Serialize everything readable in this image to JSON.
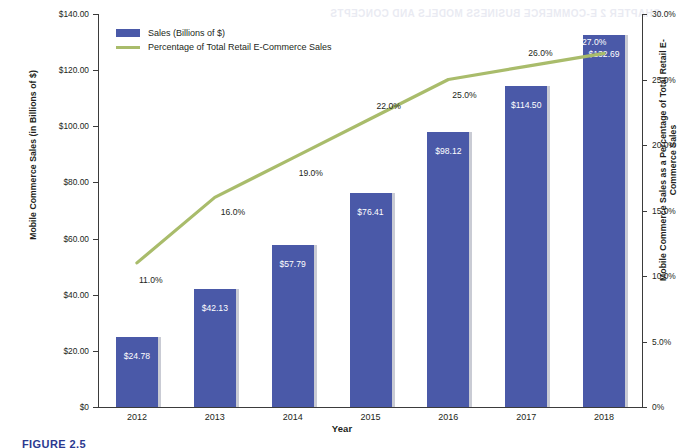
{
  "figure": {
    "caption": "FIGURE 2.5"
  },
  "legend": {
    "position": "top-left",
    "items": [
      {
        "label": "Sales (Billions of $)",
        "type": "bar",
        "color": "#4a59a8"
      },
      {
        "label": "Percentage of Total Retail E-Commerce Sales",
        "type": "line",
        "color": "#a9bc6b"
      }
    ]
  },
  "chart_data": {
    "type": "bar",
    "title": "",
    "subtitle": "",
    "xlabel": "Year",
    "ylabel": "Mobile Commerce Sales (in Billions of $)",
    "y2label": "Mobile Commerce Sales as a Percentage of Total Retail E-Commerce Sales",
    "categories": [
      "2012",
      "2013",
      "2014",
      "2015",
      "2016",
      "2017",
      "2018"
    ],
    "ylim": [
      0,
      140
    ],
    "y2lim": [
      0,
      30
    ],
    "grid": false,
    "legend_position": "top-left",
    "y_ticks": [
      "$0",
      "$20.00",
      "$40.00",
      "$60.00",
      "$80.00",
      "$100.00",
      "$120.00",
      "$140.00"
    ],
    "y_tick_values": [
      0,
      20,
      40,
      60,
      80,
      100,
      120,
      140
    ],
    "y2_ticks": [
      "0%",
      "5.0%",
      "10.0%",
      "15.0%",
      "20.0%",
      "25.0%",
      "30.0%"
    ],
    "y2_tick_values": [
      0,
      5,
      10,
      15,
      20,
      25,
      30
    ],
    "series": [
      {
        "name": "Sales (Billions of $)",
        "type": "bar",
        "axis": "left",
        "color": "#4a59a8",
        "values": [
          24.78,
          42.13,
          57.79,
          76.41,
          98.12,
          114.5,
          132.69
        ],
        "data_labels": [
          "$24.78",
          "$42.13",
          "$57.79",
          "$76.41",
          "$98.12",
          "$114.50",
          "$132.69"
        ]
      },
      {
        "name": "Percentage of Total Retail E-Commerce Sales",
        "type": "line",
        "axis": "right",
        "color": "#a9bc6b",
        "values": [
          11.0,
          16.0,
          19.0,
          22.0,
          25.0,
          26.0,
          27.0
        ],
        "data_labels": [
          "11.0%",
          "16.0%",
          "19.0%",
          "22.0%",
          "25.0%",
          "26.0%",
          "27.0%"
        ]
      }
    ]
  },
  "ghost_text": {
    "line1": "CHAPTER 2  E-COMMERCE BUSINESS MODELS AND CONCEPTS"
  }
}
